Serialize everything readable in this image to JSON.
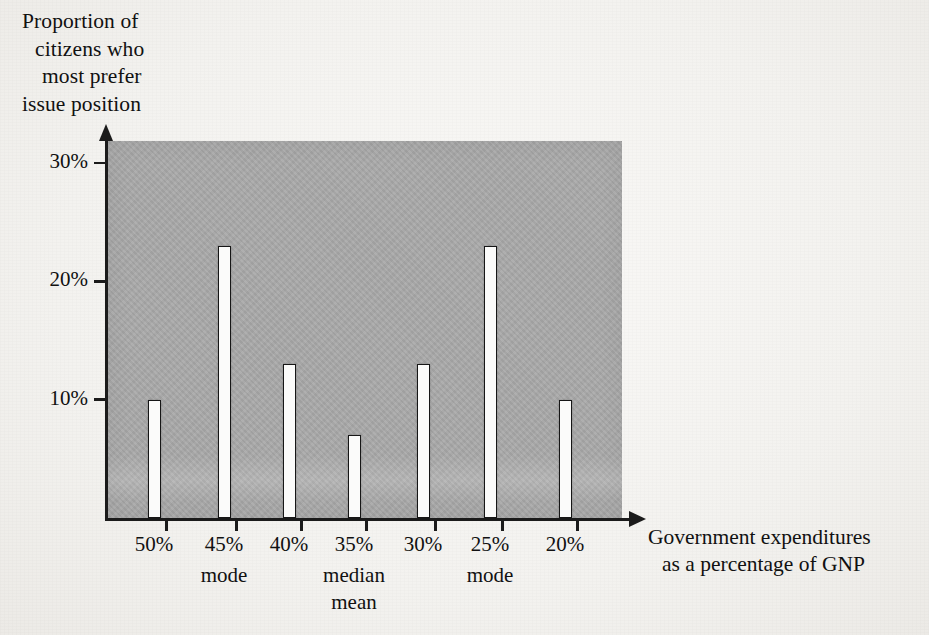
{
  "chart_data": {
    "type": "bar",
    "title": "",
    "subtitle": "",
    "xlabel": "Government expenditures as a percentage of GNP",
    "xlabel_lines": [
      "Government expenditures",
      "as a percentage of GNP"
    ],
    "ylabel": "Proportion of citizens who most prefer issue position",
    "ylabel_lines": [
      "Proportion of",
      "citizens who",
      "most prefer",
      "issue position"
    ],
    "categories": [
      "50%",
      "45%",
      "40%",
      "35%",
      "30%",
      "25%",
      "20%"
    ],
    "values": [
      10,
      23,
      13,
      7,
      13,
      23,
      10
    ],
    "value_labels": [
      "10%",
      "23%",
      "13%",
      "7%",
      "13%",
      "23%",
      "10%"
    ],
    "ylim": [
      0,
      32
    ],
    "yticks": [
      10,
      20,
      30
    ],
    "ytick_labels": [
      "10%",
      "20%",
      "30%"
    ],
    "grid": false,
    "legend": "none",
    "annotations": [
      {
        "category": "45%",
        "lines": [
          "mode"
        ]
      },
      {
        "category": "35%",
        "lines": [
          "median",
          "mean"
        ]
      },
      {
        "category": "25%",
        "lines": [
          "mode"
        ]
      }
    ],
    "colors": {
      "plot_background": "#a9a9a9",
      "paper_background": "#f4f3f1",
      "bar_fill": "#fbfbfa",
      "bar_outline": "#161616",
      "axis": "#1b1b1b",
      "text": "#111111"
    }
  },
  "geometry": {
    "plot_left_px": 108,
    "plot_top_px": 141,
    "plot_width_px": 514,
    "plot_height_px": 378,
    "baseline_y_px": 518,
    "px_per_percent": 11.83,
    "bar_width_px": 13,
    "bar_centers_px": [
      154,
      224,
      289,
      354,
      423,
      490,
      565
    ],
    "ytick_y_px": [
      403,
      278,
      163
    ]
  }
}
